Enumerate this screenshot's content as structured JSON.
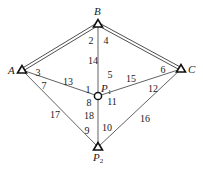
{
  "colors": {
    "line": "#3a3a3a",
    "text": "#1a1a1a",
    "background": "#ffffff"
  },
  "points": {
    "A": {
      "label": "A",
      "x": 22,
      "y": 70,
      "symbol": "triangle"
    },
    "B": {
      "label": "B",
      "x": 98,
      "y": 24,
      "symbol": "triangle"
    },
    "C": {
      "label": "C",
      "x": 181,
      "y": 69,
      "symbol": "triangle"
    },
    "P1": {
      "label": "P",
      "sub": "1",
      "x": 98,
      "y": 96,
      "symbol": "circle"
    },
    "P2": {
      "label": "P",
      "sub": "2",
      "x": 98,
      "y": 147,
      "symbol": "triangle"
    }
  },
  "edges": [
    {
      "from": "A",
      "to": "B",
      "style": "double"
    },
    {
      "from": "B",
      "to": "C",
      "style": "double"
    },
    {
      "from": "A",
      "to": "P1",
      "style": "single"
    },
    {
      "from": "B",
      "to": "P1",
      "style": "single"
    },
    {
      "from": "C",
      "to": "P1",
      "style": "single"
    },
    {
      "from": "P1",
      "to": "P2",
      "style": "single"
    },
    {
      "from": "A",
      "to": "P2",
      "style": "single"
    },
    {
      "from": "C",
      "to": "P2",
      "style": "single"
    }
  ],
  "angle_labels": [
    {
      "id": "1",
      "x": 88,
      "y": 93
    },
    {
      "id": "2",
      "x": 91,
      "y": 44
    },
    {
      "id": "3",
      "x": 38,
      "y": 76
    },
    {
      "id": "4",
      "x": 106,
      "y": 44
    },
    {
      "id": "5",
      "x": 110,
      "y": 78
    },
    {
      "id": "6",
      "x": 163,
      "y": 73
    },
    {
      "id": "7",
      "x": 44,
      "y": 89
    },
    {
      "id": "8",
      "x": 89,
      "y": 106
    },
    {
      "id": "9",
      "x": 87,
      "y": 134
    },
    {
      "id": "10",
      "x": 107,
      "y": 131
    },
    {
      "id": "11",
      "x": 112,
      "y": 105
    },
    {
      "id": "12",
      "x": 153,
      "y": 92
    },
    {
      "id": "13",
      "x": 68,
      "y": 85
    },
    {
      "id": "14",
      "x": 93,
      "y": 64
    },
    {
      "id": "15",
      "x": 131,
      "y": 82
    },
    {
      "id": "16",
      "x": 145,
      "y": 122
    },
    {
      "id": "17",
      "x": 55,
      "y": 118
    },
    {
      "id": "18",
      "x": 89,
      "y": 119
    }
  ]
}
